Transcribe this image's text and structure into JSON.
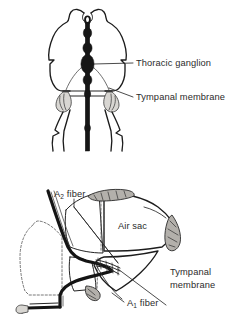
{
  "page": {
    "background_color": "#ffffff",
    "width": 243,
    "height": 327,
    "text_color": "#2b2b2b",
    "ink_color": "#161616"
  },
  "figures": [
    {
      "id": "thorax-cross-section",
      "name": "Thoracic cross-section with tympanal membranes",
      "labels": [
        {
          "id": "thoracic-ganglion",
          "text": "Thoracic ganglion",
          "x": 136,
          "y": 66
        },
        {
          "id": "tympanal-membrane",
          "text": "Tympanal membrane",
          "x": 136,
          "y": 100
        }
      ]
    },
    {
      "id": "ear-lateral-section",
      "name": "Lateral section of the ear with air sacs and auditory fibers",
      "labels": [
        {
          "id": "a2-fiber",
          "text": "A",
          "subscript": "2",
          "suffix": " fiber",
          "x": 54,
          "y": 197
        },
        {
          "id": "air-sac",
          "text": "Air sac",
          "x": 128,
          "y": 229
        },
        {
          "id": "tympanal-membrane-line1",
          "text": "Tympanal",
          "x": 172,
          "y": 272
        },
        {
          "id": "tympanal-membrane-line2",
          "text": "membrane",
          "x": 172,
          "y": 285
        },
        {
          "id": "a1-fiber",
          "text": "A",
          "subscript": "1",
          "suffix": " fiber",
          "x": 128,
          "y": 303
        }
      ]
    }
  ],
  "annotations": {
    "thoracic_ganglion": "Thoracic ganglion",
    "tympanal_membrane": "Tympanal membrane",
    "tympanal_membrane_wrapped": [
      "Tympanal",
      "membrane"
    ],
    "air_sac": "Air sac",
    "a1_fiber_base": "A",
    "a1_fiber_subscript": "1",
    "a1_fiber_suffix": " fiber",
    "a2_fiber_base": "A",
    "a2_fiber_subscript": "2",
    "a2_fiber_suffix": " fiber"
  }
}
